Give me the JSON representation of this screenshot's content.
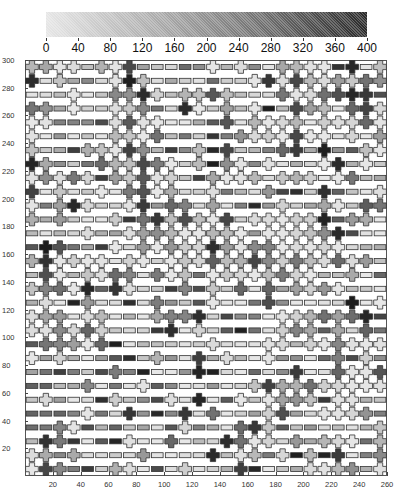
{
  "chart_data": {
    "type": "heatmap",
    "title": "",
    "colorbar": {
      "min": 0,
      "max": 400,
      "ticks": [
        0,
        40,
        80,
        120,
        160,
        200,
        240,
        280,
        320,
        360,
        400
      ],
      "colors": [
        "#e6e6e6",
        "#2a2a2a"
      ]
    },
    "xlabel": "",
    "ylabel": "",
    "xlim": [
      0,
      260
    ],
    "ylim": [
      0,
      300
    ],
    "xticks": [
      20,
      40,
      60,
      80,
      100,
      120,
      140,
      160,
      180,
      200,
      220,
      240,
      260
    ],
    "yticks": [
      20,
      40,
      60,
      80,
      100,
      120,
      140,
      160,
      180,
      200,
      220,
      240,
      260,
      280,
      300
    ],
    "grid": {
      "cols": 26,
      "rows": 30,
      "cell_x": 10,
      "cell_y": 10
    },
    "glyph_legend": {
      "C": "cross",
      "B": "bar"
    },
    "rows_top_to_bottom": [
      "CCCCBCCCBBBBBCBCBBCCCCBCBC",
      "CBCBBBCCCBBBBBBBCCCCCCCCCC",
      "BBBCBBCCCCBCCCCBBBCCCCCCCB",
      "CCBCBBCCCBBCCBCBCBBCCCBCCC",
      "CCBBBBCCCCBBBBCBCCCCBCCCCC",
      "CBBBBBCCCCBBBBBCCCCCCCBCBC",
      "CBBBCCCCCBBBCBCBBBCCBCBBCC",
      "CCBBBCCCCCCBCBCCBCBBBCCBCB",
      "CCCCCBCCCCCBBCCCCBCCCBCCBB",
      "CBCBBCBCCCCBBCBBBCBBBCBBBC",
      "CBCCCBBCCBCCBCBBBBCBBCCBCC",
      "CBCBBBCBCCCCCCCBCCCCCCBCCB",
      "BBBBCBBCCCCCCCCCBCCCCCCBBB",
      "BCCBBBCBCCCCCCCCCCCCCCCBBB",
      "CCCCCCBCCBCCCCCCCCCCCCCCCB",
      "BCCBCCCCBCCCBCCCCCCCCBBCBB",
      "CCCCCBCCBBBCBCBCBCBCCCCBBB",
      "BCBBCBBBBCBBBCBBBCBBBBBCBC",
      "CCCBCCBBBCCCCBBBBBCCCCCCCB",
      "CCCCCCBBBBCBCBBBBBCCCBCBCB",
      "BCCCCCBBBBBBBCBBBCCBCCCCCC",
      "CBCBBBBBBCBBCBCBBCBBBBCBCB",
      "BBBBBBCBBBBBCBBBBBBCBBCCCC",
      "BBBBCBBBCBBBBBBBCCCCCCCCCC",
      "BCBBBBCBBBCBCBBCBCCCCBCCBB",
      "BBBBCBBCBBBCBCBBBCCBBCCCCB",
      "BBCCBBBBBBBCBBBCCCBBBBBBBC",
      "BCCBBBBCBBCBBBCCCCBCBCCCBC",
      "CCBCBBBBCBBBBCBCCBCBCBCBBC",
      "CCCBBBCCBBBCBBBCBBBBCCCCBC"
    ],
    "shade_seed": 7
  }
}
